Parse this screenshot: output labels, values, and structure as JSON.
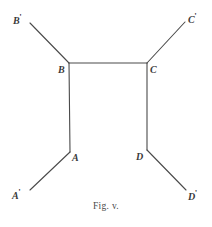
{
  "figure": {
    "caption": "Fig. v.",
    "line_color": "#4a4a4a",
    "label_color": "#3a3a3a",
    "background_color": "#ffffff",
    "vertices": [
      {
        "id": "A",
        "label": "A",
        "prime": "",
        "x": 70,
        "y": 152,
        "label_x": 72,
        "label_y": 153
      },
      {
        "id": "B",
        "label": "B",
        "prime": "",
        "x": 69,
        "y": 63,
        "label_x": 58,
        "label_y": 65
      },
      {
        "id": "C",
        "label": "C",
        "prime": "",
        "x": 147,
        "y": 63,
        "label_x": 150,
        "label_y": 65
      },
      {
        "id": "D",
        "label": "D",
        "prime": "",
        "x": 147,
        "y": 150,
        "label_x": 136,
        "label_y": 152
      },
      {
        "id": "Ap",
        "label": "A",
        "prime": "'",
        "x": 30,
        "y": 190,
        "label_x": 12,
        "label_y": 188
      },
      {
        "id": "Bp",
        "label": "B",
        "prime": "'",
        "x": 30,
        "y": 23,
        "label_x": 13,
        "label_y": 13
      },
      {
        "id": "Cp",
        "label": "C",
        "prime": "'",
        "x": 185,
        "y": 22,
        "label_x": 188,
        "label_y": 12
      },
      {
        "id": "Dp",
        "label": "D",
        "prime": "'",
        "x": 186,
        "y": 190,
        "label_x": 188,
        "label_y": 189
      }
    ],
    "segments": [
      {
        "name": "segment-b-to-bprime",
        "from": "B",
        "to": "Bp"
      },
      {
        "name": "segment-b-to-c",
        "from": "B",
        "to": "C"
      },
      {
        "name": "segment-c-to-cprime",
        "from": "C",
        "to": "Cp"
      },
      {
        "name": "segment-b-to-a",
        "from": "B",
        "to": "A"
      },
      {
        "name": "segment-c-to-d",
        "from": "C",
        "to": "D"
      },
      {
        "name": "segment-a-to-aprime",
        "from": "A",
        "to": "Ap"
      },
      {
        "name": "segment-d-to-dprime",
        "from": "D",
        "to": "Dp"
      }
    ]
  }
}
